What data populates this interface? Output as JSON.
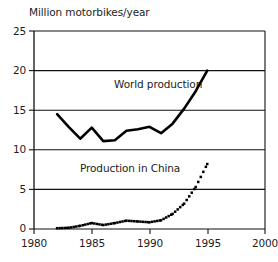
{
  "chart_data": {
    "type": "line",
    "title": "Million motorbikes/year",
    "xlabel": "",
    "ylabel": "Million motorbikes/year",
    "xlim": [
      1980,
      2000
    ],
    "ylim": [
      0,
      25
    ],
    "xticks": [
      "1980",
      "1985",
      "1990",
      "1995",
      "2000"
    ],
    "yticks": [
      "0",
      "5",
      "10",
      "15",
      "20",
      "25"
    ],
    "grid": "horizontal",
    "legend_position": "inline-annotations",
    "series": [
      {
        "name": "World production",
        "style": "solid-thick",
        "color": "#000000",
        "annotation": "World production",
        "x": [
          1982,
          1983,
          1984,
          1985,
          1986,
          1987,
          1988,
          1989,
          1990,
          1991,
          1992,
          1993,
          1994,
          1995
        ],
        "values": [
          14.5,
          12.9,
          11.4,
          12.8,
          11.1,
          11.2,
          12.4,
          12.6,
          12.9,
          12.1,
          13.3,
          15.2,
          17.4,
          20.0
        ]
      },
      {
        "name": "Production in China",
        "style": "dotted",
        "color": "#000000",
        "annotation": "Production in China",
        "x": [
          1982,
          1983,
          1984,
          1985,
          1986,
          1987,
          1988,
          1989,
          1990,
          1991,
          1992,
          1993,
          1994,
          1995
        ],
        "values": [
          0.1,
          0.15,
          0.4,
          0.75,
          0.5,
          0.75,
          1.05,
          0.95,
          0.85,
          1.1,
          1.9,
          3.2,
          5.3,
          8.2
        ]
      }
    ]
  },
  "annotations": {
    "world": "World production",
    "china": "Production in China"
  },
  "axis": {
    "y_labels": [
      "25",
      "20",
      "15",
      "10",
      "5",
      "0"
    ],
    "x_labels": [
      "1980",
      "1985",
      "1990",
      "1995",
      "2000"
    ]
  }
}
